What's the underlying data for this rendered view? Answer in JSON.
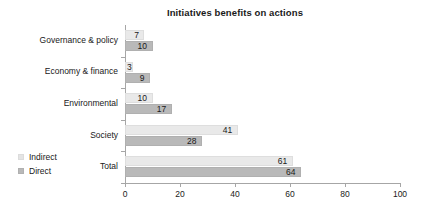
{
  "chart_data": {
    "type": "bar",
    "orientation": "horizontal",
    "title": "Initiatives benefits on actions",
    "xlabel": "",
    "ylabel": "",
    "xlim": [
      0,
      100
    ],
    "xticks": [
      "0",
      "20",
      "40",
      "60",
      "80",
      "100"
    ],
    "grid": false,
    "legend_position": "bottom-left",
    "categories": [
      "Governance & policy",
      "Economy & finance",
      "Environmental",
      "Society",
      "Total"
    ],
    "series": [
      {
        "name": "Indirect",
        "color": "#e9e9e9",
        "values": [
          7,
          3,
          10,
          41,
          61
        ]
      },
      {
        "name": "Direct",
        "color": "#b9b9b9",
        "values": [
          10,
          9,
          17,
          28,
          64
        ]
      }
    ]
  },
  "legend": {
    "items": [
      {
        "label": "Indirect"
      },
      {
        "label": "Direct"
      }
    ]
  }
}
